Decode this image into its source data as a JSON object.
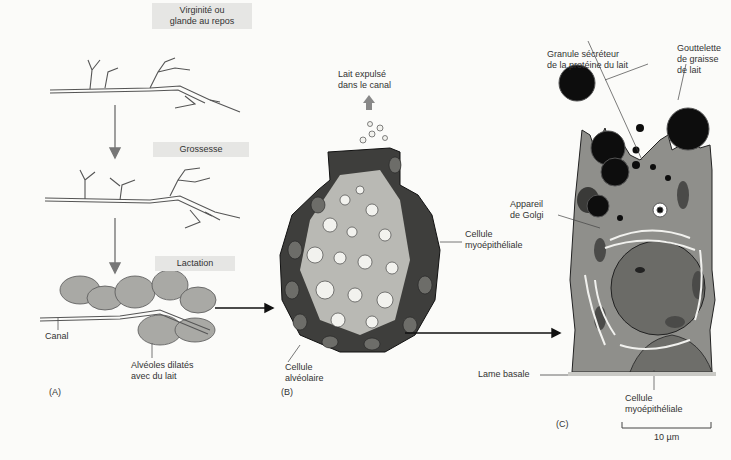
{
  "panel_a": {
    "label": "(A)",
    "stages": [
      {
        "title": "Virginité ou\nglande au repos",
        "line1": "Virginité ou",
        "line2": "glande au repos"
      },
      {
        "title": "Grossesse"
      },
      {
        "title": "Lactation"
      }
    ],
    "canal_label": "Canal",
    "alveoles_line1": "Alvéoles dilatés",
    "alveoles_line2": "avec du lait"
  },
  "panel_b": {
    "label": "(B)",
    "milk_line1": "Lait expulsé",
    "milk_line2": "dans le canal",
    "myo_line1": "Cellule",
    "myo_line2": "myoépithéliale",
    "alv_line1": "Cellule",
    "alv_line2": "alvéolaire"
  },
  "panel_c": {
    "label": "(C)",
    "granule_line1": "Granule sécréteur",
    "granule_line2": "de la protéine du lait",
    "fat_line1": "Gouttelette",
    "fat_line2": "de graisse",
    "fat_line3": "de lait",
    "golgi_line1": "Appareil",
    "golgi_line2": "de Golgi",
    "lame_label": "Lame basale",
    "myo_line1": "Cellule",
    "myo_line2": "myoépithéliale",
    "scale_label": "10 µm"
  },
  "colors": {
    "cell_fill": "#8a8a86",
    "dark": "#111111",
    "label_bg": "#e6e6e4",
    "arrow": "#777777"
  }
}
